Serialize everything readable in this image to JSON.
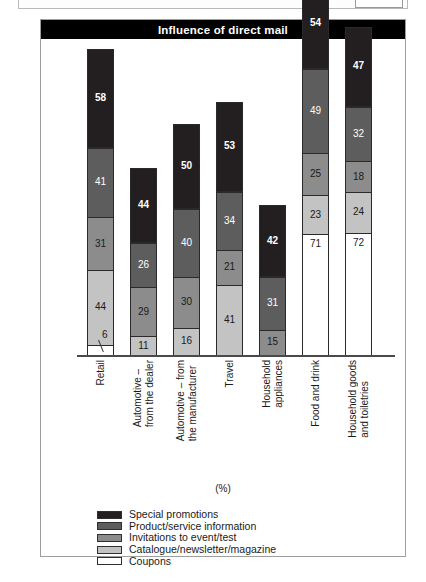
{
  "figure": {
    "title": "Influence of direct mail",
    "axis_note": "(%)"
  },
  "chart_data": {
    "type": "bar",
    "subtype": "stacked-bar",
    "title": "Influence of direct mail",
    "xlabel": "",
    "ylabel": "(%)",
    "grid": false,
    "legend_position": "bottom-left",
    "categories": [
      "Retail",
      "Automotive – from the dealer",
      "Automotive – from the manufacturer",
      "Travel",
      "Household appliances",
      "Food and drink",
      "Household goods and toiletries"
    ],
    "category_lines": [
      [
        "Retail"
      ],
      [
        "Automotive –",
        "from the dealer"
      ],
      [
        "Automotive – from",
        "the manufacturer"
      ],
      [
        "Travel"
      ],
      [
        "Household",
        "appliances"
      ],
      [
        "Food and drink"
      ],
      [
        "Household goods",
        "and toiletries"
      ]
    ],
    "series": [
      {
        "name": "Special promotions",
        "color": "#231f20",
        "values": [
          58,
          44,
          50,
          53,
          42,
          54,
          47
        ]
      },
      {
        "name": "Product/service information",
        "color": "#5d5d5d",
        "values": [
          41,
          26,
          40,
          34,
          31,
          49,
          32
        ]
      },
      {
        "name": "Invitations to event/test",
        "color": "#8c8c8c",
        "values": [
          31,
          29,
          30,
          21,
          15,
          25,
          18
        ]
      },
      {
        "name": "Catalogue/newsletter/magazine",
        "color": "#c3c3c3",
        "values": [
          44,
          11,
          16,
          41,
          null,
          23,
          24
        ]
      },
      {
        "name": "Coupons",
        "color": "#ffffff",
        "values": [
          6,
          null,
          null,
          null,
          null,
          71,
          72
        ]
      }
    ]
  },
  "legend": {
    "items": [
      {
        "label": "Special promotions",
        "color": "#231f20"
      },
      {
        "label": "Product/service information",
        "color": "#5d5d5d"
      },
      {
        "label": "Invitations to event/test",
        "color": "#8c8c8c"
      },
      {
        "label": "Catalogue/newsletter/magazine",
        "color": "#c3c3c3"
      },
      {
        "label": "Coupons",
        "color": "#ffffff"
      }
    ]
  }
}
